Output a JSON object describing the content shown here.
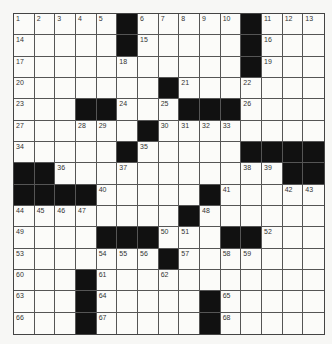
{
  "puzzle": {
    "rows": 15,
    "cols": 15,
    "layout": [
      "1,2,3,4,5,#,6,7,8,9,10,#,11,12,13",
      "14,.,.,.,.,#,15,.,.,.,.,#,16,.,.",
      "17,.,.,.,.,18,.,.,.,.,.,#,19,.,.",
      "20,.,.,.,.,.,.,#,21,.,.,22,.,.,.",
      "23,.,.,#,#,24,.,25,#,#,#,26,.,.,.",
      "27,.,.,28,29,.,#,30,31,32,33,.,.,.,.",
      "34,.,.,.,.,#,35,.,.,.,.,#,#,#,#",
      "#,#,36,.,.,37,.,.,.,.,.,38,39,#,#",
      "#,#,#,#,40,.,.,.,.,#,41,.,.,42,43",
      "44,45,46,47,.,.,.,.,#,48,.,.,.,.,.",
      "49,.,.,.,#,#,#,50,51,.,#,#,52,.,.",
      "53,.,.,.,54,55,56,#,57,.,58,59,.,.,.",
      "60,.,.,#,61,.,.,62,.,.,.,.,.,.,.",
      "63,.,.,#,64,.,.,.,.,#,65,.,.,.,.",
      "66,.,.,#,67,.,.,.,.,#,68,.,.,.,."
    ]
  }
}
